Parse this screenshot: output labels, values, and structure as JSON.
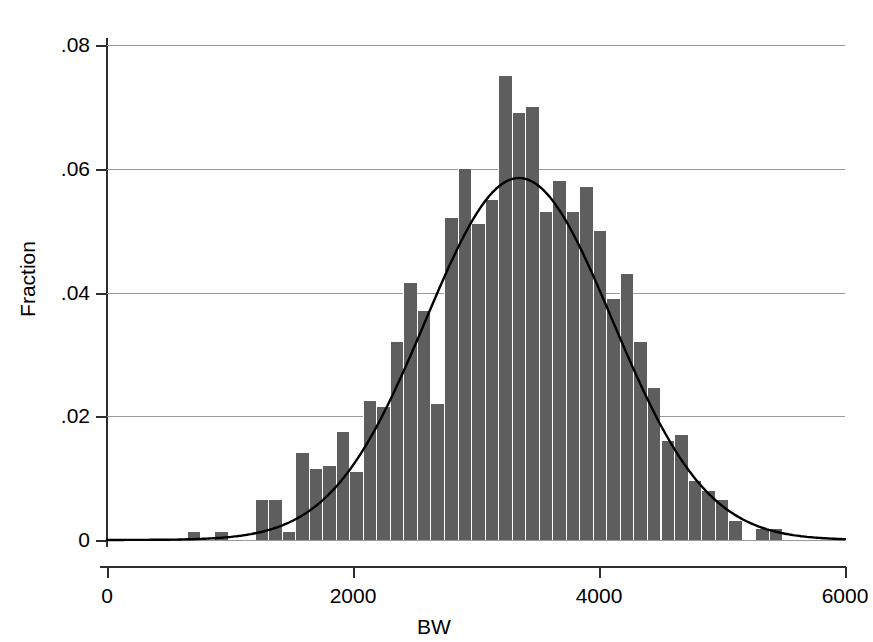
{
  "chart_data": {
    "type": "bar",
    "title": "",
    "subtitle": "",
    "xlabel": "BW",
    "ylabel": "Fraction",
    "xlim": [
      0,
      6000
    ],
    "ylim": [
      0,
      0.08
    ],
    "grid": true,
    "legend_position": "none",
    "x_ticks": [
      "0",
      "2000",
      "4000",
      "6000"
    ],
    "x_tick_values": [
      0,
      2000,
      4000,
      6000
    ],
    "y_ticks": [
      "0",
      ".02",
      ".04",
      ".06",
      ".08"
    ],
    "y_tick_values": [
      0,
      0.02,
      0.04,
      0.06,
      0.08
    ],
    "bin_width": 110,
    "bar_color": "#5e5e5e",
    "curve_color": "#000000",
    "grid_color": "#9a9a9a",
    "axis_color": "#2e2e2e",
    "categories": [
      705,
      815,
      925,
      1035,
      1145,
      1255,
      1365,
      1475,
      1585,
      1695,
      1805,
      1915,
      2025,
      2135,
      2245,
      2355,
      2465,
      2575,
      2685,
      2795,
      2905,
      3015,
      3125,
      3235,
      3345,
      3455,
      3565,
      3675,
      3785,
      3895,
      4005,
      4115,
      4225,
      4335,
      4445,
      4555,
      4665,
      4775,
      4885,
      4995,
      5105,
      5215,
      5325,
      5435,
      5545
    ],
    "values": [
      0.0013,
      0.0,
      0.0013,
      0.0,
      0.0,
      0.0065,
      0.0065,
      0.0013,
      0.014,
      0.0115,
      0.012,
      0.0175,
      0.011,
      0.0225,
      0.0215,
      0.032,
      0.0415,
      0.037,
      0.022,
      0.052,
      0.06,
      0.051,
      0.055,
      0.075,
      0.069,
      0.07,
      0.053,
      0.058,
      0.053,
      0.057,
      0.05,
      0.039,
      0.043,
      0.032,
      0.0245,
      0.016,
      0.017,
      0.0095,
      0.008,
      0.0065,
      0.003,
      0.0,
      0.0018,
      0.0018,
      0.0
    ],
    "series": [
      {
        "name": "Fraction",
        "type": "bar",
        "values": [
          0.0013,
          0.0,
          0.0013,
          0.0,
          0.0,
          0.0065,
          0.0065,
          0.0013,
          0.014,
          0.0115,
          0.012,
          0.0175,
          0.011,
          0.0225,
          0.0215,
          0.032,
          0.0415,
          0.037,
          0.022,
          0.052,
          0.06,
          0.051,
          0.055,
          0.075,
          0.069,
          0.07,
          0.053,
          0.058,
          0.053,
          0.057,
          0.05,
          0.039,
          0.043,
          0.032,
          0.0245,
          0.016,
          0.017,
          0.0095,
          0.008,
          0.0065,
          0.003,
          0.0,
          0.0018,
          0.0018,
          0.0
        ]
      },
      {
        "name": "normal density",
        "type": "line",
        "mean": 3350,
        "sd": 760,
        "peak": 0.0585
      }
    ],
    "annotations": []
  }
}
